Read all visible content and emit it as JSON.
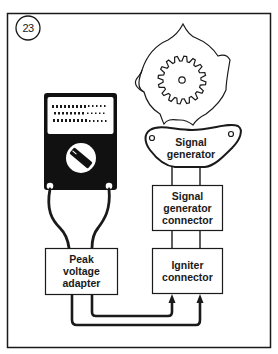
{
  "figure": {
    "number": "23",
    "colors": {
      "ink": "#1a1a1a",
      "background": "#ffffff"
    }
  },
  "components": {
    "meter": {
      "type": "multimeter",
      "display_rows": 3,
      "dial": "selector-knob"
    },
    "rotor": {
      "type": "reluctor-gear"
    },
    "signal_generator": {
      "lines": [
        "Signal",
        "generator"
      ]
    },
    "signal_generator_connector": {
      "lines": [
        "Signal",
        "generator",
        "connector"
      ]
    },
    "igniter_connector": {
      "lines": [
        "Igniter",
        "connector"
      ]
    },
    "peak_voltage_adapter": {
      "lines": [
        "Peak",
        "voltage",
        "adapter"
      ]
    }
  },
  "connections": [
    {
      "from": "meter",
      "to": "peak_voltage_adapter",
      "wires": 2
    },
    {
      "from": "signal_generator",
      "to": "signal_generator_connector",
      "wires": 2
    },
    {
      "from": "signal_generator_connector",
      "to": "igniter_connector",
      "wires": 2
    },
    {
      "from": "peak_voltage_adapter",
      "to": "igniter_connector",
      "wires": 2,
      "arrowheads": true
    }
  ]
}
